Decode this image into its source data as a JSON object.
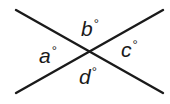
{
  "diagram": {
    "type": "intersecting-lines",
    "line_color": "#1a1a1a",
    "background": "#ffffff",
    "lines": [
      {
        "name": "line-descending",
        "x1": 16,
        "y1": 10,
        "x2": 163,
        "y2": 93
      },
      {
        "name": "line-ascending",
        "x1": 16,
        "y1": 93,
        "x2": 163,
        "y2": 10
      }
    ],
    "intersection": {
      "x": 89,
      "y": 52
    },
    "angles": [
      {
        "id": "a",
        "variable": "a",
        "unit": "°",
        "position": "left"
      },
      {
        "id": "b",
        "variable": "b",
        "unit": "°",
        "position": "top"
      },
      {
        "id": "c",
        "variable": "c",
        "unit": "°",
        "position": "right"
      },
      {
        "id": "d",
        "variable": "d",
        "unit": "°",
        "position": "bottom"
      }
    ]
  }
}
